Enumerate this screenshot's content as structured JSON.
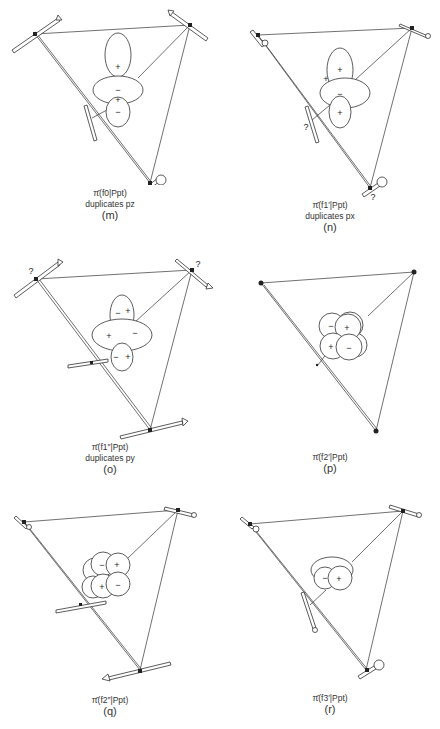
{
  "figure": {
    "panels": [
      {
        "id": "m",
        "title": "π̄(f0|Ppt)",
        "subtitle": "duplicates pz",
        "label": "(m)",
        "orbital": "f0",
        "signs": [
          "+",
          "−",
          "+",
          "−"
        ],
        "question_marks": []
      },
      {
        "id": "n",
        "title": "π̄(f1′|Ppt)",
        "subtitle": "duplicates px",
        "label": "(n)",
        "orbital": "f1'",
        "signs": [
          "+",
          "+",
          "−",
          "+"
        ],
        "question_marks": [
          "?",
          "?"
        ]
      },
      {
        "id": "o",
        "title": "π̄(f1″|Ppt)",
        "subtitle": "duplicates py",
        "label": "(o)",
        "orbital": "f1''",
        "signs": [
          "−",
          "+",
          "+",
          "−",
          "−",
          "+"
        ],
        "question_marks": [
          "?",
          "?"
        ]
      },
      {
        "id": "p",
        "title": "π̄(f2′|Ppt)",
        "subtitle": "",
        "label": "(p)",
        "orbital": "f2'",
        "signs": [
          "−",
          "+",
          "+",
          "−"
        ],
        "question_marks": []
      },
      {
        "id": "q",
        "title": "π̄(f2″|Ppt)",
        "subtitle": "",
        "label": "(q)",
        "orbital": "f2''",
        "signs": [
          "−",
          "+",
          "+",
          "−"
        ],
        "question_marks": []
      },
      {
        "id": "r",
        "title": "π̄(f3′|Ppt)",
        "subtitle": "",
        "label": "(r)",
        "orbital": "f3'",
        "signs": [
          "−",
          "+"
        ],
        "question_marks": []
      }
    ],
    "colors": {
      "line": "#333333",
      "background": "#ffffff"
    }
  }
}
